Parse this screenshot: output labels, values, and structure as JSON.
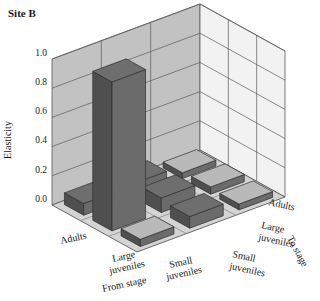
{
  "chart_data": {
    "type": "bar",
    "title": "Site B",
    "subtitle": "",
    "xlabel": "From stage",
    "ylabel": "Elasticity",
    "zlabel": "To stage",
    "projection": "3d-matrix",
    "grid": true,
    "legend_position": "none",
    "ylim": [
      0.0,
      1.0
    ],
    "yticks": [
      "0.0",
      "0.2",
      "0.4",
      "0.6",
      "0.8",
      "1.0"
    ],
    "ytick_values": [
      0.0,
      0.2,
      0.4,
      0.6,
      0.8,
      1.0
    ],
    "from_stage_categories": [
      "Adults",
      "Large juveniles",
      "Small juveniles"
    ],
    "to_stage_categories": [
      "Adults",
      "Large juveniles",
      "Small juveniles"
    ],
    "matrix": [
      {
        "from": "Adults",
        "to": "Adults",
        "value": 0.08
      },
      {
        "from": "Large juveniles",
        "to": "Adults",
        "value": 1.02
      },
      {
        "from": "Small juveniles",
        "to": "Adults",
        "value": 0.05
      },
      {
        "from": "Adults",
        "to": "Large juveniles",
        "value": 0.09
      },
      {
        "from": "Large juveniles",
        "to": "Large juveniles",
        "value": 0.1
      },
      {
        "from": "Small juveniles",
        "to": "Large juveniles",
        "value": 0.08
      },
      {
        "from": "Adults",
        "to": "Small juveniles",
        "value": 0.04
      },
      {
        "from": "Large juveniles",
        "to": "Small juveniles",
        "value": 0.05
      },
      {
        "from": "Small juveniles",
        "to": "Small juveniles",
        "value": 0.04
      }
    ],
    "colors": {
      "bar_top_light": "#b9b9b9",
      "bar_top_dark": "#6e6e6e",
      "bar_side": "#555555",
      "left_wall": "#c2c2c2",
      "right_wall": "#f2f2f2",
      "floor": "#d4d4d4",
      "grid_line": "#5a5a5a",
      "text": "#1a1a1a"
    }
  },
  "labels": {
    "title": "Site B",
    "y_axis": "Elasticity",
    "x_axis": "From stage",
    "z_axis": "To stage",
    "tick_0": "0.0",
    "tick_1": "0.2",
    "tick_2": "0.4",
    "tick_3": "0.6",
    "tick_4": "0.8",
    "tick_5": "1.0",
    "from_adults": "Adults",
    "from_large_1": "Large",
    "from_large_2": "juveniles",
    "from_small_1": "Small",
    "from_small_2": "juveniles",
    "to_adults": "Adults",
    "to_large_1": "Large",
    "to_large_2": "juveniles",
    "to_small_1": "Small",
    "to_small_2": "juveniles"
  }
}
